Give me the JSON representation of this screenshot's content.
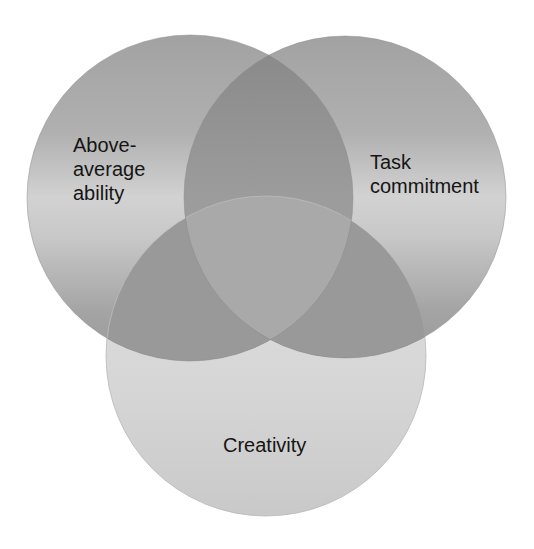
{
  "diagram": {
    "type": "venn",
    "sets": [
      {
        "id": "ability",
        "lines": [
          "Above-",
          "average",
          "ability"
        ]
      },
      {
        "id": "task",
        "lines": [
          "Task",
          "commitment"
        ]
      },
      {
        "id": "creativity",
        "lines": [
          "Creativity"
        ]
      }
    ],
    "colors": {
      "top_circles_dark": "#9c9c9c",
      "top_circles_light": "#d4d4d4",
      "bottom_circle": "#d9d9d9",
      "pair_overlap": "#8f8f8f",
      "bottom_overlap": "#989898",
      "center_overlap": "#a9a9a9",
      "text": "#151515"
    }
  }
}
